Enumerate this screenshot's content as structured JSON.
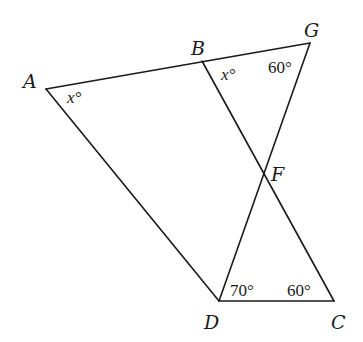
{
  "diagram": {
    "type": "geometry",
    "vertices": {
      "A": {
        "label": "A",
        "x": 46,
        "y": 89
      },
      "B": {
        "label": "B",
        "x": 202,
        "y": 61
      },
      "G": {
        "label": "G",
        "x": 310,
        "y": 43
      },
      "F": {
        "label": "F",
        "x": 264,
        "y": 174
      },
      "D": {
        "label": "D",
        "x": 219,
        "y": 301
      },
      "C": {
        "label": "C",
        "x": 334,
        "y": 301
      }
    },
    "segments": [
      {
        "from": "A",
        "to": "G",
        "name": "segment-AG"
      },
      {
        "from": "A",
        "to": "D",
        "name": "segment-AD"
      },
      {
        "from": "B",
        "to": "C",
        "name": "segment-BC"
      },
      {
        "from": "G",
        "to": "D",
        "name": "segment-GD"
      },
      {
        "from": "D",
        "to": "C",
        "name": "segment-DC"
      }
    ],
    "angle_labels": {
      "A": {
        "text": "x°",
        "vertex": "A"
      },
      "B": {
        "text": "x°",
        "vertex": "B"
      },
      "G": {
        "text": "60°",
        "vertex": "G"
      },
      "D": {
        "text": "70°",
        "vertex": "D"
      },
      "C": {
        "text": "60°",
        "vertex": "C"
      }
    }
  }
}
